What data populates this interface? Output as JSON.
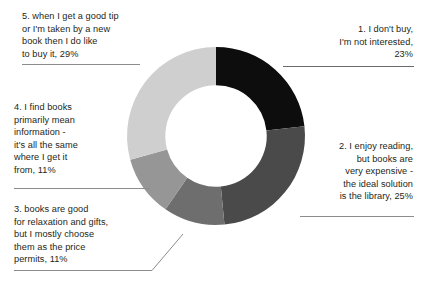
{
  "chart_data": {
    "type": "pie",
    "variant": "donut",
    "title": "",
    "xlabel": "",
    "ylabel": "",
    "legend_position": "callout-labels",
    "grid": false,
    "hole_ratio": 0.57,
    "start_angle_deg": 0,
    "direction": "clockwise",
    "units": "percent",
    "categories": [
      "1. I don't buy, I'm not interested",
      "2. I enjoy reading, but books are very expensive - the ideal solution is the library",
      "3. books are good for relaxation and gifts, but I mostly choose them as the price permits",
      "4. I find books primarily mean information - it's all the same where I get it from",
      "5. when I get a good tip or I'm taken by a new book then I do like to buy it"
    ],
    "values": [
      23,
      25,
      11,
      11,
      29
    ],
    "colors": [
      "#0d0d0d",
      "#4a4a4a",
      "#6e6e6e",
      "#969696",
      "#cfcfcf"
    ],
    "slices": [
      {
        "index": 1,
        "label": "1. I don't buy,\nI'm not interested,\n23%",
        "value": 23,
        "color": "#0d0d0d"
      },
      {
        "index": 2,
        "label": "2. I enjoy reading,\nbut books are\nvery expensive -\nthe ideal solution\nis the library, 25%",
        "value": 25,
        "color": "#4a4a4a"
      },
      {
        "index": 3,
        "label": "3. books are good\nfor relaxation and gifts,\nbut I mostly choose\nthem as the price\npermits, 11%",
        "value": 11,
        "color": "#6e6e6e"
      },
      {
        "index": 4,
        "label": "4. I find books\nprimarily mean\ninformation -\nit's all the same\nwhere I get it\nfrom, 11%",
        "value": 11,
        "color": "#969696"
      },
      {
        "index": 5,
        "label": "5. when I get a good tip\nor I'm taken by a new\nbook then I do like\nto buy it, 29%",
        "value": 29,
        "color": "#cfcfcf"
      }
    ]
  },
  "labels": {
    "slice1": "1. I don't buy,\nI'm not interested,\n23%",
    "slice2": "2. I enjoy reading,\nbut books are\nvery expensive -\nthe ideal solution\nis the library, 25%",
    "slice3": "3. books are good\nfor relaxation and gifts,\nbut I mostly choose\nthem as the price\npermits, 11%",
    "slice4": "4. I find books\nprimarily mean\ninformation -\nit's all the same\nwhere I get it\nfrom, 11%",
    "slice5": "5. when I get a good tip\nor I'm taken by a new\nbook then I do like\nto buy it, 29%"
  },
  "style": {
    "background": "#ffffff",
    "text_color": "#231f20",
    "leader_color": "#8c8c8c"
  }
}
